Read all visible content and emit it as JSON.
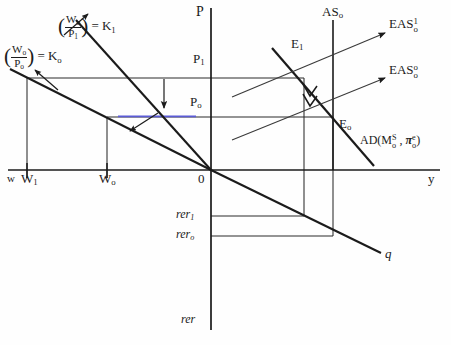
{
  "diagram": {
    "type": "economics-schematic"
  },
  "axes": {
    "vertical_price": {
      "name": "P-axis",
      "label": "P",
      "x": 211,
      "top": 8,
      "bottom": 170
    },
    "vertical_rer": {
      "name": "rer-axis",
      "label": "rer",
      "x": 211,
      "top": 170,
      "bottom": 330
    },
    "horizontal_wage": {
      "name": "w-axis",
      "label": "w",
      "y": 170,
      "left": 8,
      "right": 211
    },
    "horizontal_output": {
      "name": "y-axis",
      "label": "y",
      "y": 170,
      "left": 211,
      "right": 440
    },
    "origin_label": "0"
  },
  "ticks": {
    "wage": [
      {
        "label": "W",
        "sub": "1",
        "x": 27
      },
      {
        "label": "W",
        "sub": "o",
        "x": 107
      }
    ],
    "price": [
      {
        "label": "P",
        "sub": "1",
        "y": 78
      },
      {
        "label": "P",
        "sub": "o",
        "y": 117
      }
    ],
    "rer": [
      {
        "label": "rer",
        "sub": "1",
        "y": 216
      },
      {
        "label": "rer",
        "sub": "o",
        "y": 236
      }
    ]
  },
  "curves": {
    "real_wage_k1": {
      "name": "real-wage-line-K1",
      "label_numerator": "W",
      "label_numerator_sub": "o",
      "label_denominator": "P",
      "label_denominator_sub": "1",
      "equals": "= K",
      "equals_sub": "1",
      "full_text": "(Wo/P1) = K1"
    },
    "real_wage_k0": {
      "name": "real-wage-line-K0",
      "label_numerator": "W",
      "label_numerator_sub": "o",
      "label_denominator": "P",
      "label_denominator_sub": "o",
      "equals": "= K",
      "equals_sub": "o",
      "full_text": "(Wo/Po) = Ko"
    },
    "as_vertical": {
      "name": "AS-curve",
      "label": "AS",
      "sub": "o",
      "x": 333
    },
    "eas_1": {
      "name": "EAS-curve-1",
      "label": "EAS",
      "sup": "1",
      "sub": "o"
    },
    "eas_0": {
      "name": "EAS-curve-0",
      "label": "EAS",
      "sup": "o",
      "sub": "o"
    },
    "ad": {
      "name": "AD-curve",
      "prefix": "AD(M",
      "m_sup": "S",
      "m_sub": "o",
      "mid": " , ",
      "pi": "π",
      "pi_sup": "e",
      "pi_sub": "o",
      "suffix": ")",
      "full_text": "AD(MoS , πoe)"
    },
    "q_line": {
      "name": "q-line",
      "label": "q"
    }
  },
  "equilibria": [
    {
      "name": "equilibrium-E1",
      "label": "E",
      "sub": "1",
      "x": 304,
      "y": 78
    },
    {
      "name": "equilibrium-E0",
      "label": "E",
      "sub": "o",
      "x": 333,
      "y": 117
    }
  ],
  "annotations": {
    "price_fall_arrow": "downward-arrow-price-adjustment",
    "ad_shift_arrow": "double-chevron-along-AD",
    "k0_pointer": "arrow-to-K0-line",
    "k1_pointer": "arrow-to-K1-line"
  },
  "colors": {
    "ink": "#1b1b1b",
    "thin": "#3a3a3a",
    "accent_blue": "#5b5bd6",
    "paper": "#fefefe"
  }
}
